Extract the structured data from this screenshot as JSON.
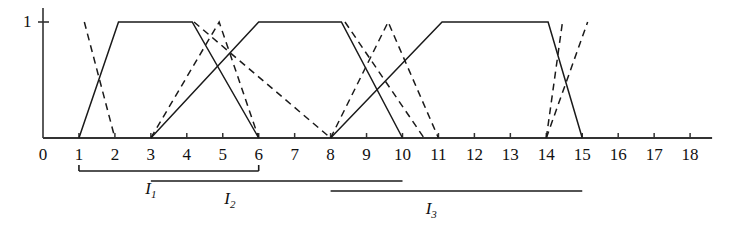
{
  "figure": {
    "title": "",
    "y_axis": {
      "tick_label": "1",
      "tick_value": 1
    },
    "x_axis": {
      "tick_labels": [
        "0",
        "1",
        "2",
        "3",
        "4",
        "5",
        "6",
        "7",
        "8",
        "9",
        "10",
        "11",
        "12",
        "13",
        "14",
        "15",
        "16",
        "17",
        "18"
      ],
      "tick_values": [
        0,
        1,
        2,
        3,
        4,
        5,
        6,
        7,
        8,
        9,
        10,
        11,
        12,
        13,
        14,
        15,
        16,
        17,
        18
      ],
      "min": 0,
      "max": 18
    },
    "intervals": [
      {
        "label": "I",
        "sub": "1",
        "start": 1,
        "end": 6,
        "center": 3.0,
        "level": 0
      },
      {
        "label": "I",
        "sub": "2",
        "start": 3,
        "end": 10,
        "center": 5.2,
        "level": 1
      },
      {
        "label": "I",
        "sub": "3",
        "start": 8,
        "end": 15,
        "center": 10.8,
        "level": 2
      }
    ]
  },
  "chart_data": {
    "type": "line",
    "title": "",
    "xlabel": "",
    "ylabel": "",
    "xlim": [
      0,
      18
    ],
    "ylim": [
      0,
      1
    ],
    "grid": false,
    "legend": "none",
    "xtick_labels": [
      "0",
      "1",
      "2",
      "3",
      "4",
      "5",
      "6",
      "7",
      "8",
      "9",
      "10",
      "11",
      "12",
      "13",
      "14",
      "15",
      "16",
      "17",
      "18"
    ],
    "ytick_labels": [
      "1"
    ],
    "series": [
      {
        "name": "solid-membership-1",
        "style": "solid",
        "color": "#1a1a1a",
        "points": [
          [
            1,
            0
          ],
          [
            2.1,
            1
          ],
          [
            4.15,
            1
          ],
          [
            6,
            0
          ]
        ]
      },
      {
        "name": "solid-membership-2",
        "style": "solid",
        "color": "#1a1a1a",
        "points": [
          [
            3,
            0
          ],
          [
            6.0,
            1
          ],
          [
            8.3,
            1
          ],
          [
            10,
            0
          ]
        ]
      },
      {
        "name": "solid-membership-3",
        "style": "solid",
        "color": "#1a1a1a",
        "points": [
          [
            8,
            0
          ],
          [
            11.1,
            1
          ],
          [
            14.05,
            1
          ],
          [
            15,
            0
          ]
        ]
      },
      {
        "name": "dashed-membership-1",
        "style": "dashed",
        "color": "#1a1a1a",
        "points": [
          [
            1.15,
            1
          ],
          [
            2,
            0
          ]
        ]
      },
      {
        "name": "dashed-membership-2",
        "style": "dashed",
        "color": "#1a1a1a",
        "points": [
          [
            3,
            0
          ],
          [
            4.9,
            1
          ],
          [
            6,
            0
          ]
        ]
      },
      {
        "name": "dashed-membership-3",
        "style": "dashed",
        "color": "#1a1a1a",
        "points": [
          [
            4.2,
            1
          ],
          [
            8,
            0
          ]
        ]
      },
      {
        "name": "dashed-membership-4",
        "style": "dashed",
        "color": "#1a1a1a",
        "points": [
          [
            8,
            0
          ],
          [
            9.6,
            1
          ],
          [
            11,
            0
          ]
        ]
      },
      {
        "name": "dashed-membership-5",
        "style": "dashed",
        "color": "#1a1a1a",
        "points": [
          [
            8.4,
            1
          ],
          [
            10.6,
            0
          ]
        ]
      },
      {
        "name": "dashed-membership-6",
        "style": "dashed",
        "color": "#1a1a1a",
        "points": [
          [
            14,
            0
          ],
          [
            15.15,
            1
          ]
        ]
      },
      {
        "name": "dashed-membership-7",
        "style": "dashed",
        "color": "#1a1a1a",
        "points": [
          [
            14,
            0
          ],
          [
            14.45,
            1
          ]
        ]
      }
    ]
  },
  "colors": {
    "ink": "#1a1a1a",
    "axis": "#333333",
    "background": "#ffffff"
  }
}
